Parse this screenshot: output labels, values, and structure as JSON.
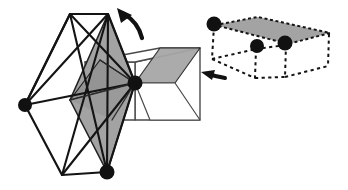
{
  "figure": {
    "canvas": {
      "width": 348,
      "height": 190,
      "background": "#ffffff"
    },
    "palette": {
      "stroke": "#1a1a1a",
      "shaded_fill": "#a0a0a0",
      "shaded_fill_light": "#b5b5b5",
      "box_stroke": "#3d3d3d",
      "vertex_dot": "#111111",
      "dashed_stroke": "#1a1a1a",
      "arrow_fill": "#111111",
      "white": "#ffffff"
    },
    "stroke_widths": {
      "net_outline": 2.2,
      "box_edge": 1.4,
      "shaded_edge": 1.8,
      "dashed_edge": 2.0
    }
  },
  "left_object": {
    "name": "hexagonal-net-with-solid-box",
    "label": "unfolded net overlapping a rectangular box",
    "net_outline": [
      [
        70,
        14
      ],
      [
        108,
        14
      ],
      [
        135,
        83
      ],
      [
        107,
        172
      ],
      [
        62,
        175
      ],
      [
        25,
        105
      ]
    ],
    "net_internal_edges": [
      [
        [
          70,
          14
        ],
        [
          25,
          105
        ]
      ],
      [
        [
          70,
          14
        ],
        [
          107,
          172
        ]
      ],
      [
        [
          108,
          14
        ],
        [
          25,
          105
        ]
      ],
      [
        [
          108,
          14
        ],
        [
          107,
          172
        ]
      ],
      [
        [
          25,
          105
        ],
        [
          135,
          83
        ]
      ],
      [
        [
          62,
          175
        ],
        [
          135,
          83
        ]
      ],
      [
        [
          62,
          175
        ],
        [
          108,
          14
        ]
      ],
      [
        [
          70,
          14
        ],
        [
          135,
          83
        ]
      ]
    ],
    "shaded_faces": [
      {
        "name": "upper-shaded-triangle",
        "points": [
          [
            108,
            14
          ],
          [
            135,
            83
          ],
          [
            70,
            100
          ]
        ],
        "tone": "mid"
      },
      {
        "name": "lower-shaded-triangle",
        "points": [
          [
            70,
            100
          ],
          [
            135,
            83
          ],
          [
            107,
            172
          ]
        ],
        "tone": "mid"
      },
      {
        "name": "left-shaded-wedge",
        "points": [
          [
            70,
            100
          ],
          [
            98,
            62
          ],
          [
            135,
            83
          ]
        ],
        "tone": "dark"
      },
      {
        "name": "box-top-shaded",
        "points": [
          [
            135,
            83
          ],
          [
            160,
            48
          ],
          [
            200,
            48
          ],
          [
            175,
            83
          ]
        ],
        "tone": "mid"
      }
    ],
    "box": {
      "name": "rectangular-box",
      "front_face": [
        [
          85,
          62
        ],
        [
          135,
          62
        ],
        [
          135,
          120
        ],
        [
          85,
          120
        ]
      ],
      "top_face": [
        [
          85,
          62
        ],
        [
          160,
          48
        ],
        [
          200,
          48
        ],
        [
          135,
          62
        ]
      ],
      "right_face": [
        [
          135,
          62
        ],
        [
          200,
          48
        ],
        [
          200,
          120
        ],
        [
          135,
          120
        ]
      ],
      "visible_corners": [
        [
          85,
          62
        ],
        [
          135,
          62
        ],
        [
          200,
          48
        ],
        [
          160,
          48
        ],
        [
          85,
          120
        ],
        [
          135,
          120
        ],
        [
          200,
          120
        ]
      ]
    },
    "vertex_dots": [
      {
        "name": "left-vertex-dot",
        "cx": 25,
        "cy": 105,
        "r": 7
      },
      {
        "name": "center-right-vertex-dot",
        "cx": 135,
        "cy": 83,
        "r": 7.5
      },
      {
        "name": "bottom-vertex-dot",
        "cx": 107,
        "cy": 172,
        "r": 7.5
      }
    ]
  },
  "right_object": {
    "name": "dashed-box-with-shaded-top",
    "label": "folded box drawn with dashed hidden edges and a shaded top face",
    "top_face": [
      [
        215,
        25
      ],
      [
        258,
        17
      ],
      [
        330,
        33
      ],
      [
        288,
        44
      ]
    ],
    "dashed_edges": [
      [
        [
          215,
          25
        ],
        [
          212,
          58
        ]
      ],
      [
        [
          288,
          44
        ],
        [
          286,
          76
        ]
      ],
      [
        [
          330,
          33
        ],
        [
          328,
          65
        ]
      ],
      [
        [
          212,
          58
        ],
        [
          255,
          76
        ]
      ],
      [
        [
          255,
          76
        ],
        [
          286,
          76
        ]
      ],
      [
        [
          286,
          76
        ],
        [
          328,
          65
        ]
      ],
      [
        [
          255,
          50
        ],
        [
          255,
          76
        ]
      ],
      [
        [
          212,
          58
        ],
        [
          255,
          50
        ]
      ],
      [
        [
          255,
          50
        ],
        [
          288,
          44
        ]
      ]
    ],
    "vertex_dots": [
      {
        "name": "right-top-left-vertex-dot",
        "cx": 214,
        "cy": 24,
        "r": 7.5
      },
      {
        "name": "right-mid-vertex-dot",
        "cx": 257,
        "cy": 46,
        "r": 7
      },
      {
        "name": "right-front-vertex-dot",
        "cx": 285,
        "cy": 43,
        "r": 7.5
      }
    ]
  },
  "arrows": [
    {
      "name": "fold-arrow-top",
      "description": "curved arrow pointing up-left above the net",
      "path": "M 141 36 C 136 24 128 17 122 14",
      "head": [
        [
          119,
          9
        ],
        [
          131,
          16
        ],
        [
          120,
          22
        ]
      ],
      "rotation_head_deg": -30
    },
    {
      "name": "fold-arrow-right",
      "description": "short flat arrow pointing left from the folded box",
      "path": "M 224 77 L 210 74",
      "head": [
        [
          203,
          73
        ],
        [
          216,
          69
        ],
        [
          214,
          79
        ]
      ]
    }
  ]
}
